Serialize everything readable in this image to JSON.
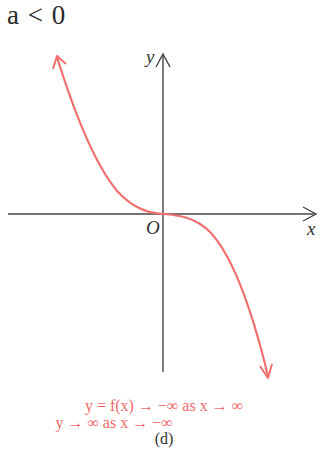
{
  "title": {
    "condition": "a < 0",
    "variable": "a",
    "relation": "<",
    "value": "0"
  },
  "axes": {
    "x_label": "x",
    "y_label": "y",
    "origin_label": "O"
  },
  "curve": {
    "description": "cubic y = f(x) with a < 0, decreasing through origin with inflection at O",
    "color": "#f07070",
    "axis_color": "#444444"
  },
  "caption": {
    "line1": "y = f(x) → −∞ as x → ∞",
    "line2": "y → ∞ as x → −∞",
    "label": "(d)"
  }
}
